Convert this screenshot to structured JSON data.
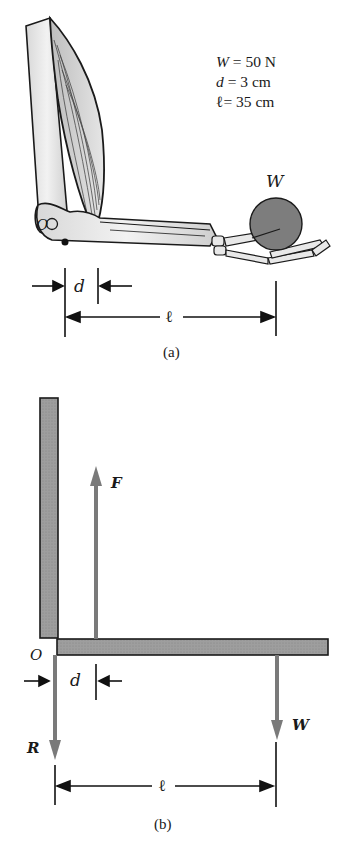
{
  "figure_a": {
    "caption": "(a)",
    "parameters": [
      {
        "symbol": "W",
        "eq": " = ",
        "value": "50 N"
      },
      {
        "symbol": "d",
        "eq": " = ",
        "value": "3 cm"
      },
      {
        "symbol": "ℓ",
        "eq": "= ",
        "value": "35 cm"
      }
    ],
    "labels": {
      "pivot": "O",
      "weight": "W",
      "d": "d",
      "l": "ℓ"
    }
  },
  "figure_b": {
    "caption": "(b)",
    "labels": {
      "force": "F",
      "pivot": "O",
      "d": "d",
      "reaction": "R",
      "weight": "W",
      "l": "ℓ"
    }
  },
  "colors": {
    "force_arrow": "#7a7a7a",
    "bar_fill": "#9a9a9a",
    "weight_ball": "#7d7d7d",
    "ink": "#1a1a1a"
  }
}
